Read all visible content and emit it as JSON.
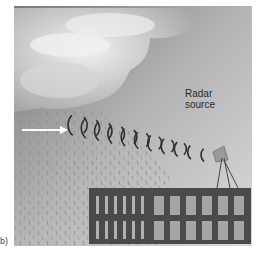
{
  "figure": {
    "label_line1": "Radar",
    "label_line2": "source",
    "panel_label": "b)"
  },
  "colors": {
    "sky_top": "#8a8a8a",
    "sky_bottom": "#cfcfcf",
    "cloud": "#e6e6e6",
    "building": "#4a4a4a",
    "window": "#a9a9a9",
    "arrow": "#ffffff",
    "wave": "#333333"
  }
}
